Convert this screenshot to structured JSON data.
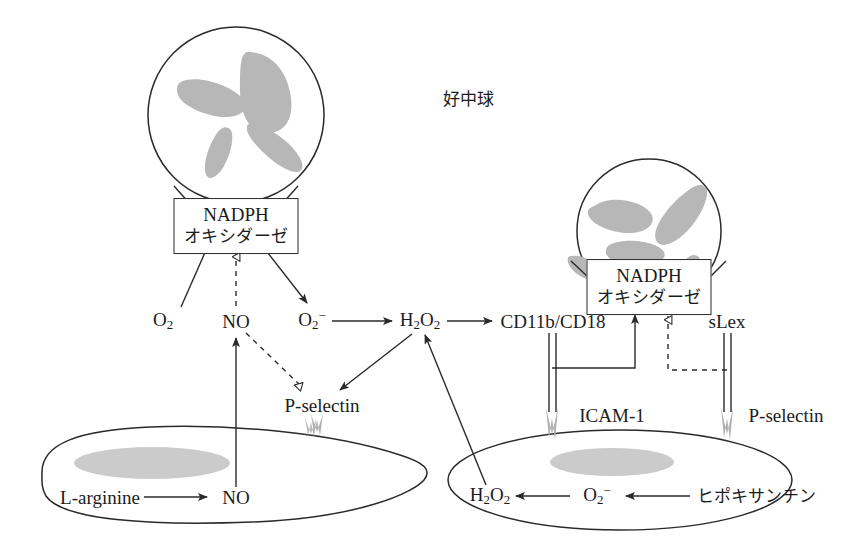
{
  "diagram": {
    "title_label": "好中球",
    "colors": {
      "stroke": "#2a2a2a",
      "nucleus": "#b7b7b7",
      "receptor": "#b0b0b0",
      "background": "#ffffff"
    }
  },
  "cells": {
    "neutrophil_left": {
      "name": "好中球",
      "enzyme_line1": "NADPH",
      "enzyme_line2": "オキシダーゼ"
    },
    "neutrophil_right": {
      "name": "好中球",
      "enzyme_line1": "NADPH",
      "enzyme_line2": "オキシダーゼ"
    },
    "endothelium_left": {
      "substrate": "L-arginine",
      "product": "NO"
    },
    "endothelium_right": {
      "product": "H2O2",
      "intermediate": "O2-",
      "substrate": "ヒポキサンチン"
    }
  },
  "labels": {
    "neutrophil_title": "好中球",
    "nadph_left_line1": "NADPH",
    "nadph_left_line2": "オキシダーゼ",
    "nadph_right_line1": "NADPH",
    "nadph_right_line2": "オキシダーゼ",
    "o2": "O",
    "o2_sub": "2",
    "no": "NO",
    "superoxide": "O",
    "superoxide_sub": "2",
    "superoxide_sup": "−",
    "h2o2_h": "H",
    "h2o2_sub1": "2",
    "h2o2_o": "O",
    "h2o2_sub2": "2",
    "cd11b_cd18": "CD11b/CD18",
    "slex": "sLex",
    "p_selectin_mid": "P-selectin",
    "icam1": "ICAM-1",
    "p_selectin_right": "P-selectin",
    "l_arginine": "L-arginine",
    "no_endothelium": "NO",
    "hypoxanthine": "ヒポキサンチン",
    "h2o2_endo_h": "H",
    "h2o2_endo_sub1": "2",
    "h2o2_endo_o": "O",
    "h2o2_endo_sub2": "2",
    "superoxide_endo": "O",
    "superoxide_endo_sub": "2",
    "superoxide_endo_sup": "−"
  },
  "edges": [
    {
      "from": "O2",
      "to": "NADPH-oxidase-left",
      "style": "solid",
      "head": "none"
    },
    {
      "from": "NO",
      "to": "NADPH-oxidase-left",
      "style": "dashed",
      "head": "hollow"
    },
    {
      "from": "NADPH-oxidase-left",
      "to": "O2-",
      "style": "solid",
      "head": "filled"
    },
    {
      "from": "O2-",
      "to": "H2O2",
      "style": "solid",
      "head": "filled"
    },
    {
      "from": "H2O2",
      "to": "CD11b/CD18",
      "style": "solid",
      "head": "filled"
    },
    {
      "from": "NO",
      "to": "P-selectin",
      "style": "dashed",
      "head": "hollow"
    },
    {
      "from": "H2O2",
      "to": "P-selectin",
      "style": "solid",
      "head": "filled"
    },
    {
      "from": "NO-endothelium",
      "to": "NO",
      "style": "solid",
      "head": "filled"
    },
    {
      "from": "L-arginine",
      "to": "NO-endothelium",
      "style": "solid",
      "head": "filled"
    },
    {
      "from": "H2O2-endothelium",
      "to": "H2O2",
      "style": "solid",
      "head": "filled"
    },
    {
      "from": "hypoxanthine",
      "to": "O2--endothelium",
      "style": "solid",
      "head": "filled"
    },
    {
      "from": "O2--endothelium",
      "to": "H2O2-endothelium",
      "style": "solid",
      "head": "filled"
    },
    {
      "from": "CD11b/CD18-ICAM-1",
      "to": "NADPH-oxidase-right",
      "style": "solid",
      "head": "filled"
    },
    {
      "from": "sLex-P-selectin",
      "to": "NADPH-oxidase-right",
      "style": "dashed",
      "head": "hollow"
    }
  ],
  "bonds": [
    {
      "receptor": "CD11b/CD18",
      "ligand": "ICAM-1",
      "style": "double-line"
    },
    {
      "receptor": "sLex",
      "ligand": "P-selectin",
      "style": "double-line"
    }
  ]
}
